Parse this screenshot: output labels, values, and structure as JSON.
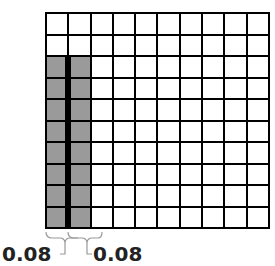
{
  "diagram": {
    "type": "decimal-grid-model",
    "grid": {
      "rows": 10,
      "columns": 10
    },
    "shaded_columns": [
      {
        "column": 1,
        "shaded_rows_from": 3,
        "shaded_rows_to": 10,
        "shaded_count": 8
      },
      {
        "column": 2,
        "shaded_rows_from": 3,
        "shaded_rows_to": 10,
        "shaded_count": 8
      }
    ],
    "colors": {
      "shaded": "#9a9a9a",
      "grid_line": "#000000",
      "background": "#ffffff"
    },
    "labels": [
      {
        "text": "0.08",
        "refers_to": "column 1"
      },
      {
        "text": "0.08",
        "refers_to": "column 2"
      }
    ]
  }
}
